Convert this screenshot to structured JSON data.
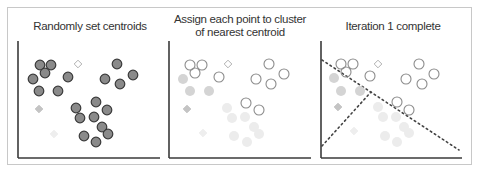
{
  "panels": [
    {
      "title": "Randomly set centroids",
      "title_lines": [
        "Randomly set centroids"
      ],
      "axis": {
        "x0": 18,
        "y0": 41,
        "x1": 160,
        "y1": 158
      },
      "points_dark": [
        [
          40,
          65
        ],
        [
          51,
          65
        ],
        [
          45,
          73
        ],
        [
          33,
          79
        ],
        [
          68,
          77
        ],
        [
          39,
          91
        ],
        [
          58,
          91
        ],
        [
          117,
          64
        ],
        [
          105,
          79
        ],
        [
          120,
          84
        ],
        [
          133,
          75
        ],
        [
          76,
          108
        ],
        [
          96,
          102
        ],
        [
          107,
          110
        ],
        [
          80,
          118
        ],
        [
          94,
          117
        ],
        [
          102,
          127
        ],
        [
          108,
          134
        ],
        [
          84,
          136
        ],
        [
          96,
          142
        ]
      ],
      "centroids": [
        {
          "x": 78,
          "y": 64,
          "style": "outline"
        },
        {
          "x": 39,
          "y": 109,
          "style": "gray"
        },
        {
          "x": 54,
          "y": 134,
          "style": "light"
        }
      ],
      "divider_lines": []
    },
    {
      "title": "Assign each point to cluster of nearest centroid",
      "title_lines": [
        "Assign each point to cluster",
        "of nearest centroid"
      ],
      "axis": {
        "x0": 169,
        "y0": 41,
        "x1": 311,
        "y1": 158
      },
      "points_open": [
        [
          190,
          65
        ],
        [
          202,
          65
        ],
        [
          195,
          73
        ],
        [
          219,
          77
        ],
        [
          269,
          64
        ],
        [
          256,
          79
        ],
        [
          284,
          74
        ],
        [
          271,
          84
        ],
        [
          246,
          103
        ],
        [
          259,
          110
        ]
      ],
      "points_gray": [
        [
          183,
          79
        ],
        [
          190,
          91
        ],
        [
          209,
          91
        ]
      ],
      "points_light": [
        [
          227,
          108
        ],
        [
          232,
          118
        ],
        [
          245,
          117
        ],
        [
          254,
          127
        ],
        [
          259,
          134
        ],
        [
          234,
          136
        ],
        [
          247,
          142
        ]
      ],
      "centroids": [
        {
          "x": 228,
          "y": 64,
          "style": "outline"
        },
        {
          "x": 187,
          "y": 109,
          "style": "gray"
        },
        {
          "x": 203,
          "y": 133,
          "style": "light"
        }
      ],
      "divider_lines": []
    },
    {
      "title": "Iteration 1 complete",
      "title_lines": [
        "Iteration 1 complete"
      ],
      "axis": {
        "x0": 321,
        "y0": 41,
        "x1": 462,
        "y1": 158
      },
      "points_open": [
        [
          341,
          64
        ],
        [
          353,
          64
        ],
        [
          346,
          72
        ],
        [
          370,
          76
        ],
        [
          419,
          64
        ],
        [
          406,
          79
        ],
        [
          434,
          74
        ],
        [
          422,
          84
        ],
        [
          397,
          102
        ],
        [
          409,
          110
        ]
      ],
      "points_gray": [
        [
          334,
          78
        ],
        [
          341,
          91
        ],
        [
          360,
          91
        ]
      ],
      "points_light": [
        [
          378,
          107
        ],
        [
          383,
          117
        ],
        [
          396,
          117
        ],
        [
          404,
          127
        ],
        [
          409,
          133
        ],
        [
          385,
          136
        ],
        [
          397,
          142
        ]
      ],
      "centroids": [
        {
          "x": 378,
          "y": 64,
          "style": "outline"
        },
        {
          "x": 338,
          "y": 107,
          "style": "gray"
        },
        {
          "x": 354,
          "y": 131,
          "style": "light"
        }
      ],
      "divider_lines": [
        {
          "x1": 322,
          "y1": 60,
          "x2": 459,
          "y2": 150
        },
        {
          "x1": 322,
          "y1": 146,
          "x2": 371,
          "y2": 92
        }
      ]
    }
  ],
  "colors": {
    "dark_fill": "#8a8a8a",
    "dark_stroke": "#3a3a3a",
    "open_stroke": "#8c8c8c",
    "gray_fill": "#d4d4d4",
    "light_fill": "#ececec",
    "axis": "#3a3a3a",
    "frame": "#c8c8c8",
    "divider": "#444444",
    "centroid_outline": "#b0b0b0",
    "centroid_gray": "#c4c4c4",
    "centroid_light": "#eeeeee"
  }
}
